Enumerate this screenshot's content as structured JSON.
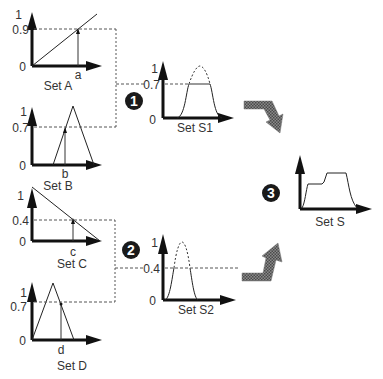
{
  "diagram": {
    "type": "fuzzy-inference",
    "colors": {
      "ink": "#111111",
      "text": "#333333",
      "arrow_fill": "#6a6a6a",
      "badge": "#1a1a1a"
    },
    "sets": {
      "A": {
        "label": "Set A",
        "input": "a",
        "y_top": "1",
        "y_level": "0.9",
        "y_zero": "0",
        "shape": "increasing-line"
      },
      "B": {
        "label": "Set B",
        "input": "b",
        "y_top": "1",
        "y_level": "0.7",
        "y_zero": "0",
        "shape": "triangle"
      },
      "C": {
        "label": "Set C",
        "input": "c",
        "y_top": "1",
        "y_level": "0.4",
        "y_zero": "0",
        "shape": "decreasing-line"
      },
      "D": {
        "label": "Set D",
        "input": "d",
        "y_top": "1",
        "y_level": "0.7",
        "y_zero": "0",
        "shape": "triangle"
      },
      "S1": {
        "label": "Set S1",
        "y_top": "1",
        "y_level": "0.7",
        "y_zero": "0",
        "shape": "clipped-bell"
      },
      "S2": {
        "label": "Set S2",
        "y_top": "1",
        "y_level": "0.4",
        "y_zero": "0",
        "shape": "clipped-bell"
      },
      "S": {
        "label": "Set S",
        "shape": "aggregated"
      }
    },
    "steps": [
      {
        "number": "1",
        "description": "Rule 1: min(0.9, 0.7) = 0.7 clips S1"
      },
      {
        "number": "2",
        "description": "Rule 2: min(0.4, 0.7) = 0.4 clips S2"
      },
      {
        "number": "3",
        "description": "Aggregate S1 and S2 into S"
      }
    ]
  }
}
